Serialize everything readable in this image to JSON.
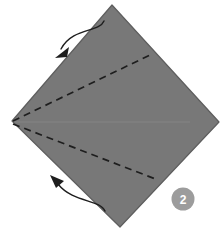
{
  "figure": {
    "type": "origami-fold-diagram",
    "background_color": "#ffffff",
    "step_badge": {
      "label": "2",
      "circle_color": "#9c9c9c",
      "text_color": "#ffffff",
      "cx": 183,
      "cy": 199,
      "r": 11.5
    },
    "paper": {
      "name": "square-sheet-diamond",
      "fill_color": "#787878",
      "stroke_color": "#5e5e5e",
      "vertices": {
        "top": [
          112,
          5
        ],
        "right": [
          219,
          122
        ],
        "bottom": [
          120,
          227
        ],
        "left": [
          12,
          121
        ]
      },
      "points_attr": "112,5 219,122 120,227 12,121"
    },
    "creases": [
      {
        "name": "upper-fold-crease",
        "style": "dashed",
        "color": "#1e1e1e",
        "from": [
          13,
          121
        ],
        "to": [
          152,
          54
        ]
      },
      {
        "name": "lower-fold-crease",
        "style": "dashed",
        "color": "#1e1e1e",
        "from": [
          13,
          124
        ],
        "to": [
          158,
          180
        ]
      },
      {
        "name": "center-horizontal-crease",
        "style": "solid-faint",
        "color": "#8a8a8a",
        "from": [
          14,
          122
        ],
        "to": [
          190,
          122
        ]
      }
    ],
    "arrows": [
      {
        "name": "upper-fold-arrow",
        "direction": "down-left",
        "color": "#1e1e1e",
        "path": "M 103,22 C 96,30 70,28 60,50",
        "head_points": "58,56 68,46 66,54"
      },
      {
        "name": "lower-fold-arrow",
        "direction": "up-left",
        "color": "#1e1e1e",
        "path": "M 104,210 C 96,200 70,200 56,182",
        "head_points": "52,176 64,182 56,186"
      }
    ]
  }
}
